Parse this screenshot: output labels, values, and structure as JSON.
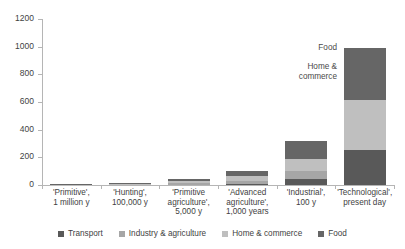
{
  "chart_data": {
    "type": "bar",
    "title": "",
    "xlabel": "",
    "ylabel": "",
    "ylim": [
      0,
      1200
    ],
    "ytick_values": [
      0,
      200,
      400,
      600,
      800,
      1000,
      1200
    ],
    "ytick_labels": [
      "0",
      "200",
      "400",
      "600",
      "800",
      "1000",
      "1200"
    ],
    "grid": false,
    "stacked": true,
    "legend_position": "bottom",
    "categories": [
      "'Primitive',\n1 million y",
      "'Hunting',\n100,000 y",
      "'Primitive\nagriculture',\n5,000 y",
      "'Advanced\nagriculture',\n1,000 years",
      "'Industrial',\n100 y",
      "'Technological',\npresent day"
    ],
    "category_lines": [
      [
        "'Primitive',",
        "1 million y"
      ],
      [
        "'Hunting',",
        "100,000 y"
      ],
      [
        "'Primitive",
        "agriculture',",
        "5,000 y"
      ],
      [
        "'Advanced",
        "agriculture',",
        "1,000 years"
      ],
      [
        "'Industrial',",
        "100 y"
      ],
      [
        "'Technological',",
        "present day"
      ]
    ],
    "series": [
      {
        "name": "Transport",
        "color": "#595959",
        "values": [
          0,
          0,
          0,
          8,
          40,
          255
        ]
      },
      {
        "name": "Industry & agriculture",
        "color": "#a6a6a6",
        "values": [
          0,
          0,
          12,
          22,
          60,
          0
        ]
      },
      {
        "name": "Home & commerce",
        "color": "#bfbfbf",
        "values": [
          2,
          4,
          16,
          38,
          90,
          360
        ]
      },
      {
        "name": "Food",
        "color": "#666666",
        "values": [
          4,
          8,
          12,
          32,
          130,
          375
        ]
      }
    ],
    "totals": [
      6,
      12,
      40,
      100,
      320,
      990
    ],
    "annotations": [
      {
        "text": "Food",
        "series": "Food"
      },
      {
        "text": "Home &",
        "series": "Home & commerce"
      },
      {
        "text": "commerce",
        "series": "Home & commerce"
      }
    ]
  },
  "legend": {
    "items": [
      {
        "label": "Transport",
        "color": "#595959"
      },
      {
        "label": "Industry & agriculture",
        "color": "#a6a6a6"
      },
      {
        "label": "Home & commerce",
        "color": "#bfbfbf"
      },
      {
        "label": "Food",
        "color": "#666666"
      }
    ]
  },
  "annotations": {
    "food": "Food",
    "home_line1": "Home &",
    "home_line2": "commerce"
  }
}
